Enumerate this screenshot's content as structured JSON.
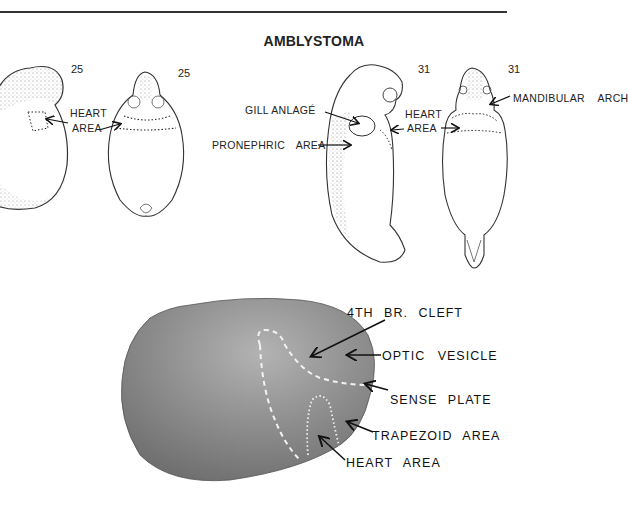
{
  "figure": {
    "title": "AMBLYSTOMA",
    "drawings": [
      {
        "id": "stage25-lateral",
        "stage": "25",
        "labels": [
          "HEART",
          "AREA"
        ]
      },
      {
        "id": "stage25-ventral",
        "stage": "25"
      },
      {
        "id": "stage31-lateral",
        "stage": "31",
        "labels": [
          "GILL ANLAGÉ",
          "PRONEPHRIC AREA",
          "HEART",
          "AREA"
        ]
      },
      {
        "id": "stage31-ventral",
        "stage": "31",
        "labels": [
          "MANDIBULAR ARCH"
        ]
      }
    ],
    "labels": {
      "s25_heart": "HEART",
      "s25_area": "AREA",
      "gill_anlage": "GILL ANLAGÉ",
      "pronephric_area": "PRONEPHRIC AREA",
      "s31_heart": "HEART",
      "s31_area": "AREA",
      "mandibular_arch": "MANDIBULAR ARCH",
      "stage_25a": "25",
      "stage_25b": "25",
      "stage_31a": "31",
      "stage_31b": "31"
    },
    "photo_labels": {
      "br_cleft": "4TH BR. CLEFT",
      "optic_vesicle": "OPTIC VESICLE",
      "sense_plate": "SENSE PLATE",
      "trapezoid_area": "TRAPEZOID AREA",
      "heart_area": "HEART AREA"
    },
    "colors": {
      "ink": "#222222",
      "photo_dark": "#6f6f6f",
      "photo_light": "#a9a9a9",
      "dashed_line": "#f2f2f2"
    }
  }
}
